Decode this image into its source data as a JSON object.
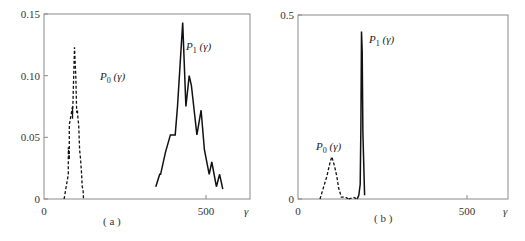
{
  "chart_data": [
    {
      "panel": "(a)",
      "type": "line",
      "title": "",
      "caption": "( a )",
      "xlabel": "γ",
      "ylabel": "",
      "xlim": [
        0,
        635
      ],
      "ylim": [
        0,
        0.15
      ],
      "x_ticks": [
        0,
        500
      ],
      "x_tick_labels": [
        "0",
        "500"
      ],
      "y_ticks": [
        0,
        0.05,
        0.1,
        0.15
      ],
      "y_tick_labels": [
        "0",
        "0.05",
        "0.10",
        "0.15"
      ],
      "grid": false,
      "legend": "inline labels",
      "series": [
        {
          "name": "P0(γ)",
          "label_main": "P",
          "label_sub": "0",
          "label_arg": " (γ)",
          "style": "dashed",
          "x": [
            62,
            75,
            75,
            78,
            78,
            88,
            88,
            94,
            98,
            101,
            103,
            105,
            107,
            110,
            113,
            116,
            118,
            120,
            121,
            122
          ],
          "y": [
            0.0,
            0.02,
            0.042,
            0.032,
            0.06,
            0.075,
            0.065,
            0.123,
            0.1,
            0.07,
            0.072,
            0.065,
            0.06,
            0.04,
            0.032,
            0.02,
            0.01,
            0.008,
            0.006,
            0.0
          ]
        },
        {
          "name": "P1(γ)",
          "label_main": "P",
          "label_sub": "1",
          "label_arg": " (γ)",
          "style": "solid",
          "x": [
            345,
            357,
            360,
            375,
            390,
            405,
            412,
            428,
            438,
            448,
            455,
            472,
            485,
            495,
            510,
            518,
            532,
            542,
            552
          ],
          "y": [
            0.01,
            0.02,
            0.02,
            0.038,
            0.052,
            0.052,
            0.075,
            0.143,
            0.075,
            0.1,
            0.092,
            0.052,
            0.072,
            0.04,
            0.02,
            0.03,
            0.01,
            0.02,
            0.008
          ]
        }
      ]
    },
    {
      "panel": "(b)",
      "type": "line",
      "title": "",
      "caption": "( b )",
      "xlabel": "γ",
      "ylabel": "",
      "xlim": [
        0,
        620
      ],
      "ylim": [
        0,
        0.5
      ],
      "x_ticks": [
        0,
        500
      ],
      "x_tick_labels": [
        "0",
        "500"
      ],
      "y_ticks": [
        0,
        0.5
      ],
      "y_tick_labels": [
        "0",
        "0.5"
      ],
      "grid": false,
      "legend": "inline labels",
      "series": [
        {
          "name": "P0(γ)",
          "label_main": "P",
          "label_sub": "0",
          "label_arg": " (γ)",
          "style": "dashed",
          "x": [
            65,
            85,
            95,
            100,
            108,
            115,
            120,
            125,
            128,
            140,
            150
          ],
          "y": [
            0.0,
            0.06,
            0.1,
            0.115,
            0.09,
            0.06,
            0.03,
            0.015,
            0.005,
            0.005,
            0.0
          ],
          "tail_x": [
            150,
            165,
            175
          ],
          "tail_y": [
            0.0,
            0.004,
            0.0
          ]
        },
        {
          "name": "P1(γ)",
          "label_main": "P",
          "label_sub": "1",
          "label_arg": " (γ)",
          "style": "solid",
          "x": [
            175,
            180,
            184,
            186,
            188,
            190,
            192,
            197
          ],
          "y": [
            0.0,
            0.01,
            0.04,
            0.2,
            0.455,
            0.4,
            0.18,
            0.01
          ]
        }
      ]
    }
  ],
  "panels": {
    "a": {
      "caption": "( a )",
      "x_axis_var": "γ",
      "y_labels": [
        "0.15",
        "0.10",
        "0.05",
        "0"
      ],
      "x_labels": [
        "0",
        "500"
      ]
    },
    "b": {
      "caption": "( b )",
      "x_axis_var": "γ",
      "y_labels": [
        "0.5",
        "0"
      ],
      "x_labels": [
        "0",
        "500"
      ]
    }
  }
}
